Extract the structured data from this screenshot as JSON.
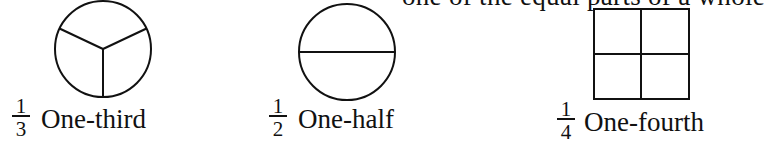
{
  "header": {
    "partial_text": "one of the equal parts of a whole"
  },
  "figures": [
    {
      "shape": "circle",
      "divisions": 3,
      "fraction": {
        "numerator": "1",
        "denominator": "3"
      },
      "label": "One-third"
    },
    {
      "shape": "circle",
      "divisions": 2,
      "fraction": {
        "numerator": "1",
        "denominator": "2"
      },
      "label": "One-half"
    },
    {
      "shape": "square",
      "divisions": 4,
      "fraction": {
        "numerator": "1",
        "denominator": "4"
      },
      "label": "One-fourth"
    }
  ],
  "colors": {
    "ink": "#111111",
    "background": "#ffffff"
  }
}
